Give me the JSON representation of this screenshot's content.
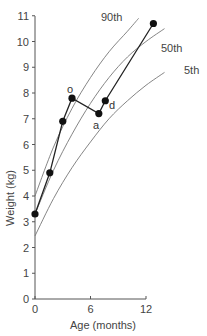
{
  "chart_data": {
    "type": "line",
    "title": "",
    "xlabel": "Age (months)",
    "ylabel": "Weight (kg)",
    "xlim": [
      0,
      12
    ],
    "ylim": [
      0,
      11
    ],
    "xticks": [
      "0",
      "6",
      "12"
    ],
    "yticks": [
      "0",
      "1",
      "2",
      "3",
      "4",
      "5",
      "6",
      "7",
      "8",
      "9",
      "10",
      "11"
    ],
    "grid": false,
    "legend": "none (curves labeled inline)",
    "series": [
      {
        "name": "90th",
        "kind": "percentile-curve",
        "x": [
          0,
          2,
          4,
          6,
          8,
          10,
          11.2
        ],
        "y": [
          4.0,
          5.9,
          7.4,
          8.6,
          9.6,
          10.4,
          10.9
        ]
      },
      {
        "name": "50th",
        "kind": "percentile-curve",
        "x": [
          0,
          2,
          4,
          6,
          8,
          10,
          12,
          14
        ],
        "y": [
          3.3,
          5.0,
          6.4,
          7.6,
          8.6,
          9.4,
          10.0,
          10.5
        ]
      },
      {
        "name": "5th",
        "kind": "percentile-curve",
        "x": [
          0,
          2,
          4,
          6,
          8,
          10,
          12,
          14
        ],
        "y": [
          2.45,
          3.9,
          5.1,
          6.1,
          7.0,
          7.7,
          8.3,
          8.8
        ]
      },
      {
        "name": "Infant weight",
        "kind": "measured-points",
        "x": [
          0,
          1.6,
          3.0,
          4.0,
          6.9,
          7.6,
          12.8
        ],
        "y": [
          3.3,
          4.9,
          6.9,
          7.8,
          7.2,
          7.7,
          10.7
        ],
        "point_labels": [
          "",
          "",
          "",
          "o",
          "a",
          "d",
          ""
        ]
      }
    ],
    "annotations": [
      {
        "text": "o",
        "x": 3.8,
        "y": 8.1
      },
      {
        "text": "a",
        "x": 6.7,
        "y": 6.7
      },
      {
        "text": "d",
        "x": 8.1,
        "y": 7.3
      }
    ]
  },
  "labels": {
    "ylabel": "Weight (kg)",
    "xlabel": "Age (months)",
    "p90": "90th",
    "p50": "50th",
    "p5": "5th",
    "o": "o",
    "a": "a",
    "d": "d"
  }
}
